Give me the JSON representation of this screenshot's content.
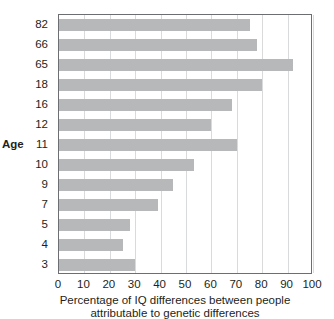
{
  "chart_data": {
    "type": "bar",
    "orientation": "horizontal",
    "title": "",
    "xlabel_line1": "Percentage of IQ differences between people",
    "xlabel_line2": "attributable to genetic differences",
    "ylabel": "Age",
    "categories": [
      "82",
      "66",
      "65",
      "18",
      "16",
      "12",
      "11",
      "10",
      "9",
      "7",
      "5",
      "4",
      "3"
    ],
    "values": [
      75,
      78,
      92,
      80,
      68,
      60,
      70,
      53,
      45,
      39,
      28,
      25,
      30
    ],
    "xlim": [
      0,
      100
    ],
    "xticks": [
      0,
      10,
      20,
      30,
      40,
      50,
      60,
      70,
      80,
      90,
      100
    ],
    "xtick_labels": [
      "0",
      "10",
      "20",
      "30",
      "40",
      "50",
      "60",
      "70",
      "80",
      "90",
      "100"
    ],
    "grid": "vertical",
    "legend": "none",
    "bar_color": "#b6b8ba",
    "gridline_color": "#d9dadb",
    "axis_color": "#6d6e71"
  }
}
